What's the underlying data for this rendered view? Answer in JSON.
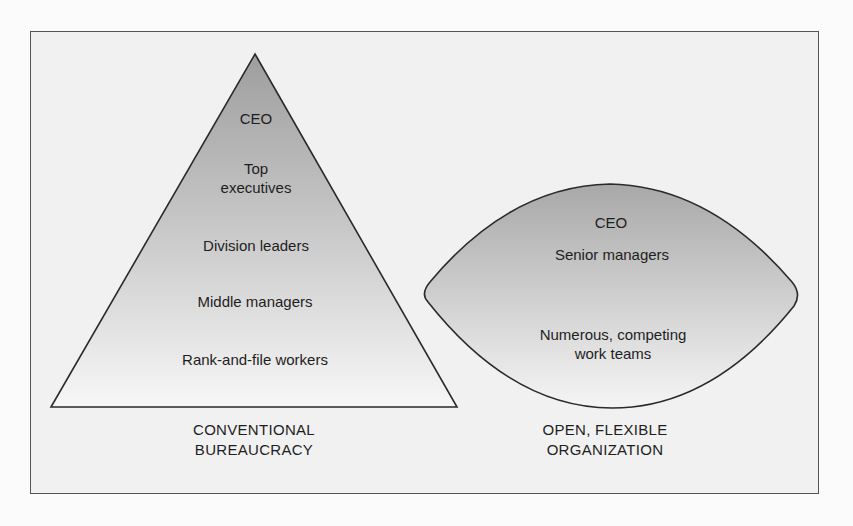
{
  "colors": {
    "frame_border": "#555555",
    "frame_bg": "#f1f1f1",
    "shape_top": "#a9a9a9",
    "shape_bottom": "#f6f6f6",
    "stroke": "#2a2a2a"
  },
  "left_figure": {
    "shape": "triangle",
    "levels": [
      "CEO",
      "Top\nexecutives",
      "Division leaders",
      "Middle managers",
      "Rank-and-file workers"
    ],
    "level_ceo": "CEO",
    "level_top_line1": "Top",
    "level_top_line2": "executives",
    "level_division": "Division leaders",
    "level_middle": "Middle managers",
    "level_rank": "Rank-and-file workers",
    "caption_line1": "CONVENTIONAL",
    "caption_line2": "BUREAUCRACY"
  },
  "right_figure": {
    "shape": "lens",
    "level_ceo": "CEO",
    "level_senior": "Senior managers",
    "level_teams_line1": "Numerous, competing",
    "level_teams_line2": "work teams",
    "caption_line1": "OPEN, FLEXIBLE",
    "caption_line2": "ORGANIZATION"
  }
}
